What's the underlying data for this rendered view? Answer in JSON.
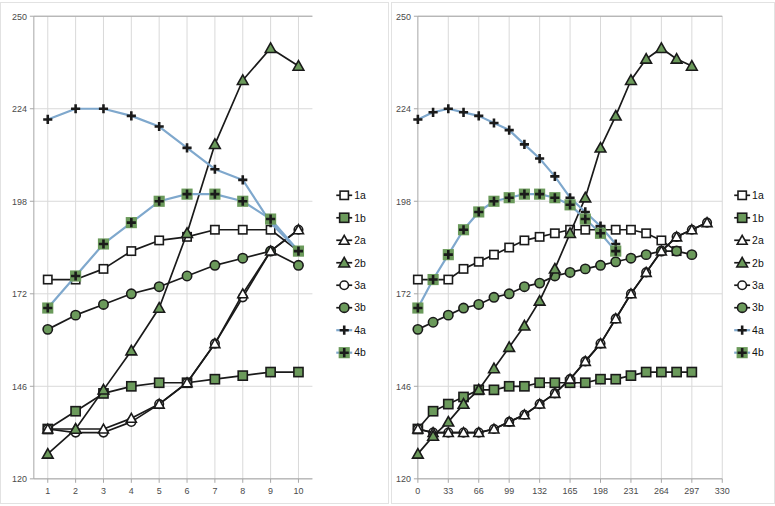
{
  "figure": {
    "panel_count": 2,
    "background": "#ffffff",
    "border_color": "#e2e2e2"
  },
  "style": {
    "black": "#1a1a1a",
    "blue": "#7fa8cd",
    "green_fill": "#6b9a5b",
    "grid": "#d9d9d9",
    "axis": "#a6a6a6",
    "white": "#ffffff"
  },
  "legend": {
    "position": "right",
    "items": [
      {
        "label": "1a",
        "marker": "square-open",
        "line_color": "#1a1a1a",
        "marker_fill": "#ffffff"
      },
      {
        "label": "1b",
        "marker": "square-filled",
        "line_color": "#1a1a1a",
        "marker_fill": "#6b9a5b"
      },
      {
        "label": "2a",
        "marker": "triangle-open",
        "line_color": "#1a1a1a",
        "marker_fill": "#ffffff"
      },
      {
        "label": "2b",
        "marker": "triangle-filled",
        "line_color": "#1a1a1a",
        "marker_fill": "#6b9a5b"
      },
      {
        "label": "3a",
        "marker": "circle-open",
        "line_color": "#1a1a1a",
        "marker_fill": "#ffffff"
      },
      {
        "label": "3b",
        "marker": "circle-filled",
        "line_color": "#1a1a1a",
        "marker_fill": "#6b9a5b"
      },
      {
        "label": "4a",
        "marker": "plus",
        "line_color": "#7fa8cd",
        "marker_fill": "#1a1a1a"
      },
      {
        "label": "4b",
        "marker": "plus-boxed",
        "line_color": "#7fa8cd",
        "marker_fill": "#6b9a5b"
      }
    ]
  },
  "chart_data": [
    {
      "id": "left",
      "type": "line",
      "title": "",
      "xlabel": "",
      "ylabel": "",
      "grid": true,
      "legend_position": "right",
      "xlim": [
        0.5,
        10.5
      ],
      "ylim": [
        120,
        250
      ],
      "xticks": [
        1,
        2,
        3,
        4,
        5,
        6,
        7,
        8,
        9,
        10
      ],
      "yticks": [
        120,
        146,
        172,
        198,
        224,
        250
      ],
      "x": [
        1,
        2,
        3,
        4,
        5,
        6,
        7,
        8,
        9,
        10
      ],
      "series": [
        {
          "name": "1a",
          "marker": "square-open",
          "line_color": "#1a1a1a",
          "marker_fill": "#ffffff",
          "values": [
            176,
            176,
            179,
            184,
            187,
            188,
            190,
            190,
            190,
            184
          ]
        },
        {
          "name": "1b",
          "marker": "square-filled",
          "line_color": "#1a1a1a",
          "marker_fill": "#6b9a5b",
          "values": [
            134,
            139,
            144,
            146,
            147,
            147,
            148,
            149,
            150,
            150
          ]
        },
        {
          "name": "2a",
          "marker": "triangle-open",
          "line_color": "#1a1a1a",
          "marker_fill": "#ffffff",
          "values": [
            134,
            134,
            134,
            137,
            141,
            147,
            158,
            172,
            184,
            190
          ]
        },
        {
          "name": "2b",
          "marker": "triangle-filled",
          "line_color": "#1a1a1a",
          "marker_fill": "#6b9a5b",
          "values": [
            127,
            134,
            145,
            156,
            168,
            189,
            214,
            232,
            241,
            236
          ]
        },
        {
          "name": "3a",
          "marker": "circle-open",
          "line_color": "#1a1a1a",
          "marker_fill": "#ffffff",
          "values": [
            134,
            133,
            133,
            136,
            141,
            147,
            158,
            171,
            184,
            190
          ]
        },
        {
          "name": "3b",
          "marker": "circle-filled",
          "line_color": "#1a1a1a",
          "marker_fill": "#6b9a5b",
          "values": [
            162,
            166,
            169,
            172,
            174,
            177,
            180,
            182,
            184,
            180
          ]
        },
        {
          "name": "4a",
          "marker": "plus",
          "line_color": "#7fa8cd",
          "marker_fill": "#1a1a1a",
          "values": [
            221,
            224,
            224,
            222,
            219,
            213,
            207,
            204,
            192,
            184
          ]
        },
        {
          "name": "4b",
          "marker": "plus-boxed",
          "line_color": "#7fa8cd",
          "marker_fill": "#6b9a5b",
          "values": [
            168,
            177,
            186,
            192,
            198,
            200,
            200,
            198,
            193,
            184
          ]
        }
      ]
    },
    {
      "id": "right",
      "type": "line",
      "title": "",
      "xlabel": "",
      "ylabel": "",
      "grid": true,
      "legend_position": "right",
      "xlim": [
        0,
        330
      ],
      "ylim": [
        120,
        250
      ],
      "xticks": [
        0,
        33,
        66,
        99,
        132,
        165,
        198,
        231,
        264,
        297,
        330
      ],
      "yticks": [
        120,
        146,
        172,
        198,
        224,
        250
      ],
      "x": [
        0,
        16.5,
        33,
        49.5,
        66,
        82.5,
        99,
        115.5,
        132,
        148.5,
        165,
        181.5,
        198,
        214.5,
        231,
        247.5,
        264,
        280.5,
        297,
        313.5,
        330
      ],
      "series": [
        {
          "name": "1a",
          "marker": "square-open",
          "line_color": "#1a1a1a",
          "marker_fill": "#ffffff",
          "values": [
            176,
            176,
            176,
            179,
            181,
            183,
            185,
            187,
            188,
            189,
            190,
            190,
            190,
            190,
            190,
            189,
            187,
            184,
            null,
            null,
            null
          ]
        },
        {
          "name": "1b",
          "marker": "square-filled",
          "line_color": "#1a1a1a",
          "marker_fill": "#6b9a5b",
          "values": [
            134,
            139,
            141,
            143,
            145,
            145,
            146,
            146,
            147,
            147,
            147,
            147,
            148,
            148,
            149,
            150,
            150,
            150,
            150,
            null,
            null
          ]
        },
        {
          "name": "2a",
          "marker": "triangle-open",
          "line_color": "#1a1a1a",
          "marker_fill": "#ffffff",
          "values": [
            134,
            133,
            133,
            133,
            133,
            134,
            136,
            138,
            141,
            144,
            148,
            153,
            158,
            165,
            172,
            178,
            184,
            188,
            190,
            192,
            null
          ]
        },
        {
          "name": "2b",
          "marker": "triangle-filled",
          "line_color": "#1a1a1a",
          "marker_fill": "#6b9a5b",
          "values": [
            127,
            132,
            136,
            141,
            145,
            151,
            157,
            163,
            170,
            179,
            189,
            199,
            213,
            222,
            232,
            238,
            241,
            238,
            236,
            null,
            null
          ]
        },
        {
          "name": "3a",
          "marker": "circle-open",
          "line_color": "#1a1a1a",
          "marker_fill": "#ffffff",
          "values": [
            134,
            133,
            133,
            133,
            133,
            134,
            136,
            138,
            141,
            144,
            148,
            153,
            158,
            165,
            172,
            178,
            184,
            188,
            190,
            192,
            null
          ]
        },
        {
          "name": "3b",
          "marker": "circle-filled",
          "line_color": "#1a1a1a",
          "marker_fill": "#6b9a5b",
          "values": [
            162,
            164,
            166,
            168,
            169,
            171,
            172,
            174,
            175,
            177,
            178,
            179,
            180,
            181,
            182,
            183,
            184,
            184,
            183,
            null,
            null
          ]
        },
        {
          "name": "4a",
          "marker": "plus",
          "line_color": "#7fa8cd",
          "marker_fill": "#1a1a1a",
          "values": [
            221,
            223,
            224,
            223,
            222,
            220,
            218,
            214,
            210,
            205,
            199,
            195,
            191,
            186,
            null,
            null,
            null,
            null,
            null,
            null,
            null
          ]
        },
        {
          "name": "4b",
          "marker": "plus-boxed",
          "line_color": "#7fa8cd",
          "marker_fill": "#6b9a5b",
          "values": [
            168,
            176,
            183,
            190,
            195,
            198,
            199,
            200,
            200,
            199,
            197,
            193,
            189,
            184,
            null,
            null,
            null,
            null,
            null,
            null,
            null
          ]
        }
      ]
    }
  ]
}
